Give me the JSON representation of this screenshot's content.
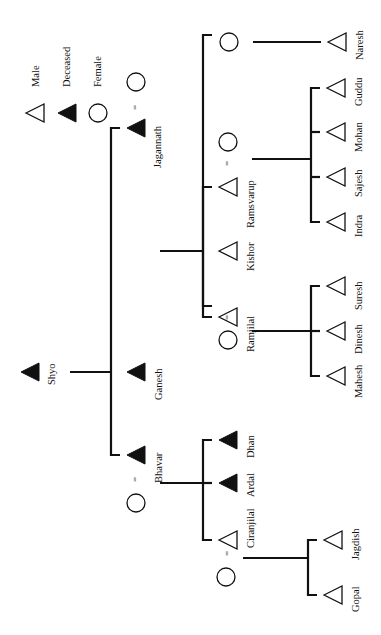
{
  "legend": {
    "items": [
      {
        "symbol": "triangle-open",
        "label": "Male"
      },
      {
        "symbol": "triangle-filled",
        "label": "Deceased"
      },
      {
        "symbol": "circle-open",
        "label": "Female"
      }
    ]
  },
  "people": {
    "shyo": "Shyo",
    "jagannath": "Jagannath",
    "ganesh": "Ganesh",
    "bhavar": "Bhavar",
    "ramsvarup": "Ramsvarup",
    "kishor": "Kishor",
    "ramjilal": "Ramjilal",
    "indra": "Indra",
    "sajesh": "Sajesh",
    "mohan": "Mohan",
    "guddu": "Guddu",
    "naresh": "Naresh",
    "mahesh": "Mahesh",
    "dinesh": "Dinesh",
    "suresh": "Suresh",
    "dhan": "Dhan",
    "ardal": "Ardal",
    "ciranjilal": "Ciranjilal",
    "jagdish": "Jagdish",
    "gopal": "Gopal"
  },
  "marriage_symbol": "="
}
